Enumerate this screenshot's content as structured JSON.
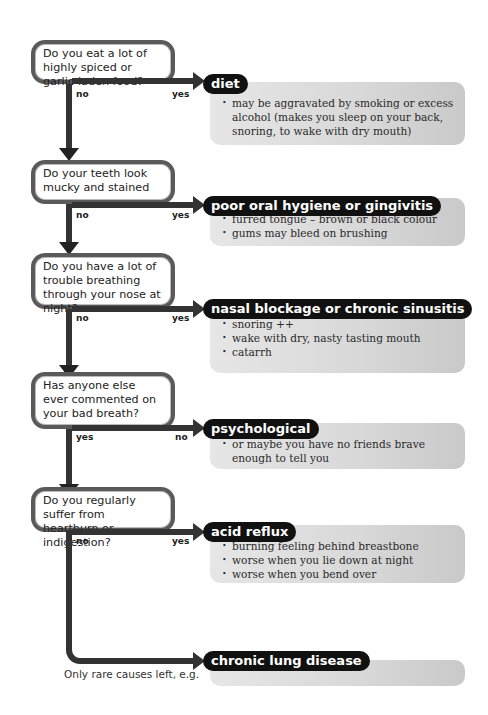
{
  "flowchart": {
    "questions": [
      {
        "text": "Do you eat a lot of highly spiced or garlic-laden food?",
        "down_label": "no",
        "right_label": "yes"
      },
      {
        "text": "Do your teeth look mucky and stained",
        "down_label": "no",
        "right_label": "yes"
      },
      {
        "text": "Do you have a lot of trouble breathing through your nose at night?",
        "down_label": "no",
        "right_label": "yes"
      },
      {
        "text": "Has anyone else ever commented on your bad breath?",
        "down_label": "yes",
        "right_label": "no"
      },
      {
        "text": "Do you regularly suffer from heartburn or indigestion?",
        "down_label": "no",
        "right_label": "yes"
      }
    ],
    "diagnoses": [
      {
        "title": "diet",
        "bullets": [
          "may be aggravated by smoking or excess alcohol (makes you sleep on your back, snoring, to wake with dry mouth)"
        ]
      },
      {
        "title": "poor oral hygiene or gingivitis",
        "bullets": [
          "furred tongue – brown or black colour",
          "gums may bleed on brushing"
        ]
      },
      {
        "title": "nasal blockage or chronic sinusitis",
        "bullets": [
          "snoring ++",
          "wake with dry, nasty tasting mouth",
          "catarrh"
        ]
      },
      {
        "title": "psychological",
        "bullets": [
          "or maybe you have no friends brave enough to tell you"
        ]
      },
      {
        "title": "acid reflux",
        "bullets": [
          "burning feeling behind breastbone",
          "worse when you lie down at night",
          "worse when you bend over"
        ]
      },
      {
        "title": "chronic lung disease",
        "bullets": []
      }
    ],
    "footnote": "Only rare causes left, e.g."
  }
}
